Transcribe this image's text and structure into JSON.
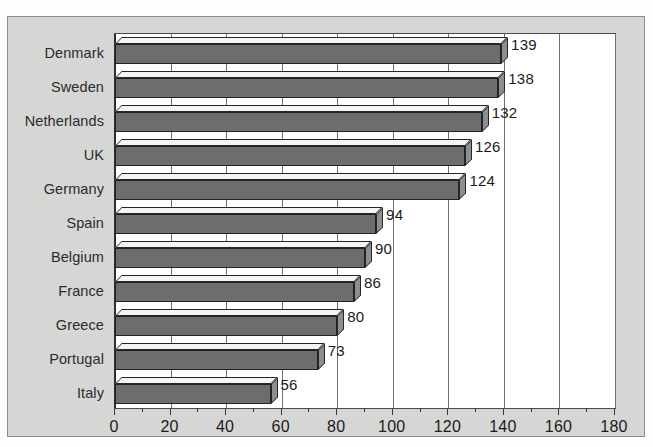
{
  "scan": {
    "top_text_sliver": ""
  },
  "chart_data": {
    "type": "bar",
    "orientation": "horizontal",
    "style": "3d",
    "title": "",
    "subtitle": "",
    "xlabel": "",
    "ylabel": "",
    "categories": [
      "Denmark",
      "Sweden",
      "Netherlands",
      "UK",
      "Germany",
      "Spain",
      "Belgium",
      "France",
      "Greece",
      "Portugal",
      "Italy"
    ],
    "values": [
      139,
      138,
      132,
      126,
      124,
      94,
      90,
      86,
      80,
      73,
      56
    ],
    "xlim": [
      0,
      180
    ],
    "xticks": [
      0,
      20,
      40,
      60,
      80,
      100,
      120,
      140,
      160,
      180
    ],
    "xtick_labels": [
      "0",
      "20",
      "40",
      "60",
      "80",
      "100",
      "120",
      "140",
      "160",
      "180"
    ],
    "grid": "vertical",
    "legend": "none",
    "colors": {
      "bar_front": "#6d6d6d",
      "bar_top": "#f5f5f3",
      "bar_side": "#8e8e8e",
      "bar_outline": "#232323",
      "plot_background": "#ffffff",
      "figure_background": "#d6d6d4",
      "gridline": "#6f6f6f",
      "axis": "#2e2e2e",
      "text": "#1b1b1b"
    },
    "data_labels": [
      "139",
      "138",
      "132",
      "126",
      "124",
      "94",
      "90",
      "86",
      "80",
      "73",
      "56"
    ]
  }
}
